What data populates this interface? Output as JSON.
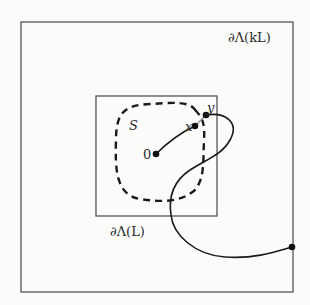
{
  "diagram": {
    "labels": {
      "outer_boundary": "∂Λ(kL)",
      "inner_boundary": "∂Λ(L)",
      "set": "S",
      "origin": "0",
      "point_x": "x",
      "point_y": "y"
    },
    "colors": {
      "background": "#fbfbfa",
      "box_stroke": "#555555",
      "curve_stroke": "#1a1a1a",
      "segment_stroke": "#9a9a9a"
    }
  }
}
